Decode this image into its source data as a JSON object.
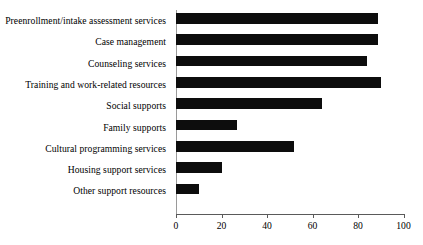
{
  "chart_data": {
    "type": "bar",
    "orientation": "horizontal",
    "title": "",
    "subtitle": "",
    "xlabel": "",
    "ylabel": "",
    "categories": [
      "Preenrollment/intake assessment services",
      "Case management",
      "Counseling services",
      "Training and work-related resources",
      "Social supports",
      "Family supports",
      "Cultural programming services",
      "Housing support services",
      "Other support resources"
    ],
    "values": [
      89,
      89,
      84,
      90,
      64,
      27,
      52,
      20,
      10
    ],
    "xlim": [
      0,
      100
    ],
    "xticks": [
      0,
      20,
      40,
      60,
      80,
      100
    ],
    "xtick_labels": [
      "0",
      "20",
      "40",
      "60",
      "80",
      "100"
    ],
    "grid": false,
    "legend": null,
    "legend_position": "none",
    "bar_color": "#0d0d0d",
    "background_color": "#ffffff",
    "axis_color": "#5a5a5a",
    "annotations": []
  }
}
